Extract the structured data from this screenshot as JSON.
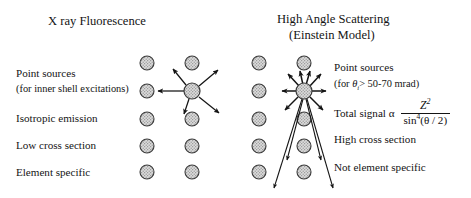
{
  "figure": {
    "kind": "comparison-diagram",
    "background": "#ffffff",
    "ink": "#141414",
    "atom_fill": "#d9d9d9",
    "atom_stroke": "#3a3a3a"
  },
  "left_panel": {
    "title": "X ray Fluorescence",
    "labels": [
      {
        "id": "point-sources",
        "line1": "Point sources",
        "line2": "(for inner shell excitations)"
      },
      {
        "id": "isotropic-emission",
        "line1": "Isotropic emission"
      },
      {
        "id": "low-cross-section",
        "line1": "Low cross section"
      },
      {
        "id": "element-specific",
        "line1": "Element specific"
      }
    ],
    "lattice": {
      "columns": 2,
      "rows": 5,
      "column_x": [
        147,
        192
      ],
      "row_y": [
        63,
        91,
        119,
        146,
        172
      ],
      "radius": 7
    },
    "emitter": {
      "x": 192,
      "y": 91,
      "radius": 8,
      "arrow_count": 5,
      "pattern": "isotropic"
    }
  },
  "right_panel": {
    "title_line1": "High Angle Scattering",
    "title_line2": "(Einstein Model)",
    "labels": [
      {
        "id": "point-sources",
        "line1": "Point sources",
        "line2_pre": "(for ",
        "line2_symbol": "θ",
        "line2_sub": "i",
        "line2_post": "> 50-70 mrad)"
      },
      {
        "id": "high-cross-section",
        "line1": "High cross section"
      },
      {
        "id": "not-element-specific",
        "line1": "Not element specific"
      }
    ],
    "formula": {
      "lhs": "Total signal α",
      "numerator": "Z",
      "numerator_exponent": "2",
      "denominator_fn": "sin",
      "denominator_exponent": "4",
      "denominator_arg": "(θ / 2)"
    },
    "lattice": {
      "columns": 2,
      "rows": 5,
      "column_x": [
        259,
        304
      ],
      "row_y": [
        63,
        91,
        119,
        146,
        172
      ],
      "radius": 7
    },
    "scatterer": {
      "x": 304,
      "y": 91,
      "radius": 8,
      "short_arrow_count": 6,
      "cone_arrow_count": 4,
      "pattern": "forward-peaked-cone"
    }
  }
}
